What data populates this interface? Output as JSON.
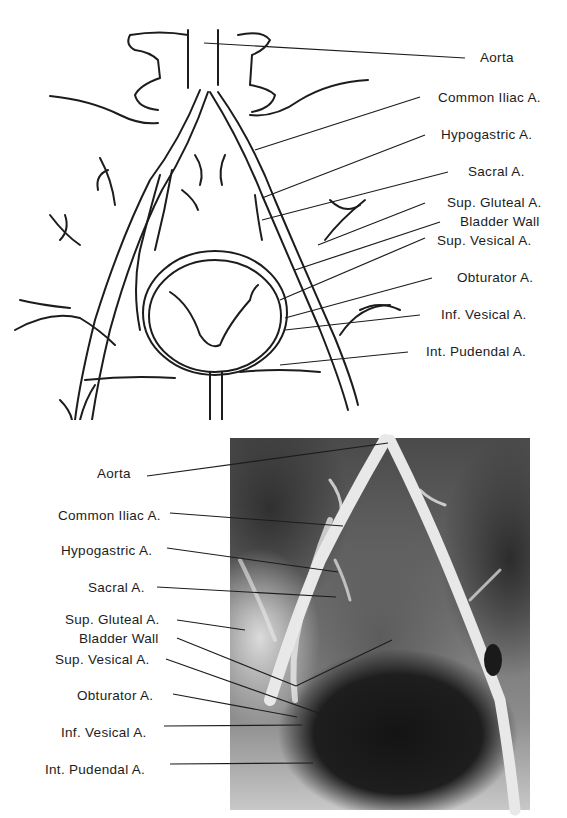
{
  "figure": {
    "top_panel": {
      "type": "line-drawing",
      "subject": "pelvic arteries and bladder (schematic)",
      "labels": [
        {
          "text": "Aorta",
          "x": 480,
          "y": 50
        },
        {
          "text": "Common Iliac A.",
          "x": 438,
          "y": 90
        },
        {
          "text": "Hypogastric A.",
          "x": 441,
          "y": 127
        },
        {
          "text": "Sacral A.",
          "x": 468,
          "y": 164
        },
        {
          "text": "Sup. Gluteal A.",
          "x": 447,
          "y": 195
        },
        {
          "text": "Bladder Wall",
          "x": 460,
          "y": 214
        },
        {
          "text": "Sup. Vesical A.",
          "x": 437,
          "y": 233
        },
        {
          "text": "Obturator A.",
          "x": 457,
          "y": 270
        },
        {
          "text": "Inf. Vesical A.",
          "x": 441,
          "y": 307
        },
        {
          "text": "Int. Pudendal A.",
          "x": 426,
          "y": 344
        }
      ]
    },
    "bottom_panel": {
      "type": "radiograph",
      "subject": "pelvic arteriogram with contrast-filled bladder",
      "labels": [
        {
          "text": "Aorta",
          "x": 97,
          "y": 474
        },
        {
          "text": "Common Iliac A.",
          "x": 58,
          "y": 516
        },
        {
          "text": "Hypogastric A.",
          "x": 61,
          "y": 551
        },
        {
          "text": "Sacral A.",
          "x": 88,
          "y": 588
        },
        {
          "text": "Sup. Gluteal A.",
          "x": 65,
          "y": 620
        },
        {
          "text": "Bladder Wall",
          "x": 79,
          "y": 639
        },
        {
          "text": "Sup. Vesical A.",
          "x": 55,
          "y": 660
        },
        {
          "text": "Obturator A.",
          "x": 77,
          "y": 696
        },
        {
          "text": "Inf. Vesical A.",
          "x": 61,
          "y": 733
        },
        {
          "text": "Int. Pudendal A.",
          "x": 45,
          "y": 770
        }
      ]
    }
  },
  "colors": {
    "ink": "#1c1c1c",
    "paper": "#ffffff",
    "film_dark": "#141414",
    "film_light": "#e6e6e6"
  }
}
